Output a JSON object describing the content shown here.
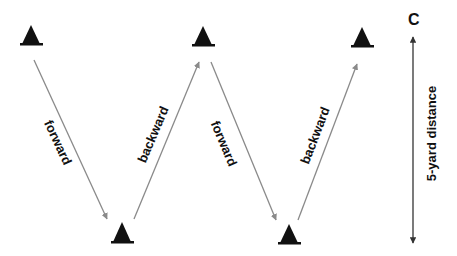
{
  "diagram": {
    "title_marker": "C",
    "distance_label": "5-yard distance",
    "colors": {
      "cone": "#111111",
      "path_arrow": "#8a8a8a",
      "distance_arrow": "#333333",
      "text": "#111111",
      "background": "#ffffff"
    },
    "cones": [
      {
        "id": 1,
        "row": "top",
        "x": 31,
        "tip_y": 25,
        "base_y": 45
      },
      {
        "id": 2,
        "row": "bottom",
        "x": 122,
        "tip_y": 222,
        "base_y": 243
      },
      {
        "id": 3,
        "row": "top",
        "x": 203,
        "tip_y": 26,
        "base_y": 46
      },
      {
        "id": 4,
        "row": "bottom",
        "x": 289,
        "tip_y": 224,
        "base_y": 244
      },
      {
        "id": 5,
        "row": "top",
        "x": 362,
        "tip_y": 27,
        "base_y": 47
      }
    ],
    "paths": [
      {
        "label": "forward",
        "from_cone": 1,
        "to_cone": 2
      },
      {
        "label": "backward",
        "from_cone": 2,
        "to_cone": 3
      },
      {
        "label": "forward",
        "from_cone": 3,
        "to_cone": 4
      },
      {
        "label": "backward",
        "from_cone": 4,
        "to_cone": 5
      }
    ]
  }
}
